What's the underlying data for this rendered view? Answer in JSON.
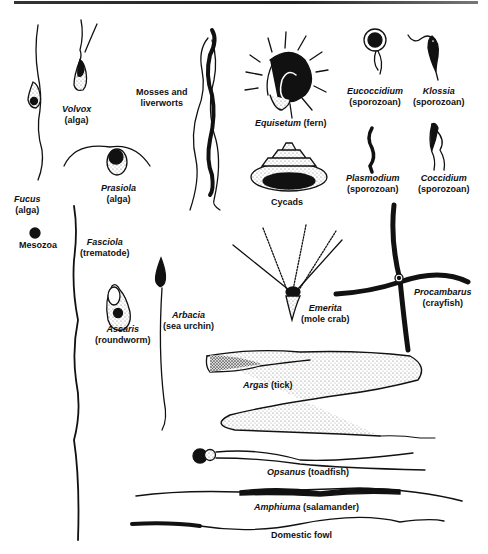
{
  "figure": {
    "items": [
      {
        "id": "fucus",
        "name": "Fucus",
        "group": "(alga)"
      },
      {
        "id": "volvox",
        "name": "Volvox",
        "group": "(alga)"
      },
      {
        "id": "prasiola",
        "name": "Prasiola",
        "group": "(alga)"
      },
      {
        "id": "mosses",
        "name": "Mosses and",
        "group": "liverworts"
      },
      {
        "id": "equisetum",
        "name": "Equisetum",
        "group": "(fern)"
      },
      {
        "id": "cycads",
        "name": "Cycads",
        "group": ""
      },
      {
        "id": "eucoccidium",
        "name": "Eucoccidium",
        "group": "(sporozoan)"
      },
      {
        "id": "klossia",
        "name": "Klossia",
        "group": "(sporozoan)"
      },
      {
        "id": "plasmodium",
        "name": "Plasmodium",
        "group": "(sporozoan)"
      },
      {
        "id": "coccidium",
        "name": "Coccidium",
        "group": "(sporozoan)"
      },
      {
        "id": "mesozoa",
        "name": "Mesozoa",
        "group": ""
      },
      {
        "id": "fasciola",
        "name": "Fasciola",
        "group": "(trematode)"
      },
      {
        "id": "ascaris",
        "name": "Ascaris",
        "group": "(roundworm)"
      },
      {
        "id": "arbacia",
        "name": "Arbacia",
        "group": "(sea urchin)"
      },
      {
        "id": "emerita",
        "name": "Emerita",
        "group": "(mole crab)"
      },
      {
        "id": "procambarus",
        "name": "Procambarus",
        "group": "(crayfish)"
      },
      {
        "id": "argas",
        "name": "Argas",
        "group": "(tick)"
      },
      {
        "id": "opsanus",
        "name": "Opsanus",
        "group": "(toadfish)"
      },
      {
        "id": "amphiuma",
        "name": "Amphiuma",
        "group": "(salamander)"
      },
      {
        "id": "fowl",
        "name": "Domestic fowl",
        "group": ""
      }
    ]
  },
  "colors": {
    "ink": "#111111",
    "background": "#ffffff",
    "stipple": "#888888"
  }
}
